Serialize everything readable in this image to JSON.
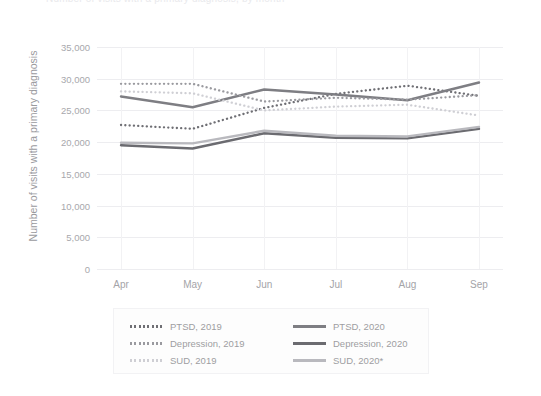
{
  "title_clipped": "Number of visits with a primary diagnosis, by month",
  "axis": {
    "ylabel": "Number of visits with a primary diagnosis",
    "yticks": [
      "0",
      "5,000",
      "10,000",
      "15,000",
      "20,000",
      "25,000",
      "30,000",
      "35,000"
    ],
    "xticks": [
      "Apr",
      "May",
      "Jun",
      "Jul",
      "Aug",
      "Sep"
    ]
  },
  "legend": {
    "items": [
      {
        "label": "PTSD, 2019",
        "color": "#6f6f74",
        "style": "dotted"
      },
      {
        "label": "PTSD, 2020",
        "color": "#7e7e83",
        "style": "solid"
      },
      {
        "label": "Depression, 2019",
        "color": "#9a9a9f",
        "style": "dotted"
      },
      {
        "label": "Depression, 2020",
        "color": "#6b6b70",
        "style": "solid"
      },
      {
        "label": "SUD, 2019",
        "color": "#cfcfd4",
        "style": "dotted"
      },
      {
        "label": "SUD, 2020*",
        "color": "#b9b9be",
        "style": "solid"
      }
    ]
  },
  "chart_data": {
    "type": "line",
    "title": "Number of visits with a primary diagnosis, by month",
    "xlabel": "",
    "ylabel": "Number of visits with a primary diagnosis",
    "categories": [
      "Apr",
      "May",
      "Jun",
      "Jul",
      "Aug",
      "Sep"
    ],
    "ylim": [
      0,
      35000
    ],
    "ytick_step": 5000,
    "grid": true,
    "legend_position": "bottom",
    "series": [
      {
        "name": "PTSD, 2019",
        "style": "dotted",
        "color": "#6f6f74",
        "values": [
          22700,
          22100,
          25400,
          27600,
          28900,
          27300
        ]
      },
      {
        "name": "PTSD, 2020",
        "style": "solid",
        "color": "#7e7e83",
        "values": [
          27200,
          25500,
          28300,
          27500,
          26600,
          29400
        ]
      },
      {
        "name": "Depression, 2019",
        "style": "dotted",
        "color": "#9a9a9f",
        "values": [
          29200,
          29200,
          26400,
          27000,
          26700,
          27400
        ]
      },
      {
        "name": "Depression, 2020",
        "style": "solid",
        "color": "#6b6b70",
        "values": [
          19500,
          19000,
          21400,
          20700,
          20600,
          22100
        ]
      },
      {
        "name": "SUD, 2019",
        "style": "dotted",
        "color": "#cfcfd4",
        "values": [
          28000,
          27700,
          25000,
          25600,
          25900,
          24200
        ]
      },
      {
        "name": "SUD, 2020*",
        "style": "solid",
        "color": "#b9b9be",
        "values": [
          19900,
          19800,
          21800,
          21000,
          20900,
          22400
        ]
      }
    ]
  }
}
